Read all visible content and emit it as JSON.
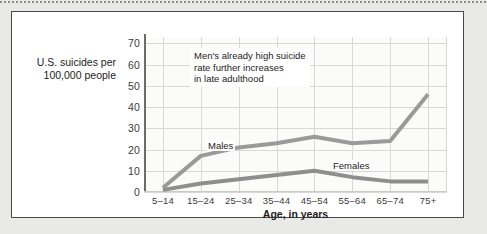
{
  "figure": {
    "y_axis_title": "U.S. suicides per\n100,000 people",
    "x_axis_title": "Age, in years",
    "annotation": "Men's already high suicide\nrate further increases\nin late adulthood",
    "males_label": "Males",
    "females_label": "Females"
  },
  "chart_data": {
    "type": "line",
    "title": "",
    "xlabel": "Age, in years",
    "ylabel": "U.S. suicides per 100,000 people",
    "categories": [
      "5–14",
      "15–24",
      "25–34",
      "35–44",
      "45–54",
      "55–64",
      "65–74",
      "75+"
    ],
    "ytick_labels": [
      "0",
      "10",
      "20",
      "30",
      "40",
      "50",
      "60",
      "70"
    ],
    "yticks": [
      0,
      10,
      20,
      30,
      40,
      50,
      60,
      70
    ],
    "ylim": [
      0,
      73
    ],
    "grid": true,
    "legend_position": "inline-labels",
    "annotations": [
      {
        "text": "Men's already high suicide rate further increases in late adulthood",
        "x_category": "25–34",
        "y": 63
      }
    ],
    "series": [
      {
        "name": "Males",
        "color": "#9a9a9a",
        "values": [
          2,
          17,
          21,
          23,
          26,
          23,
          24,
          46
        ]
      },
      {
        "name": "Females",
        "color": "#8e8e8e",
        "values": [
          1,
          4,
          6,
          8,
          10,
          7,
          5,
          5
        ]
      }
    ]
  },
  "colors": {
    "page_background": "#e9e9e7",
    "frame_border": "#4a4a4a",
    "chart_background": "#ffffff",
    "plot_background": "#fbfbfa",
    "gridline": "#d8d8d4",
    "axis": "#6b6b6b",
    "males_line": "#9a9a9a",
    "females_line": "#8e8e8e",
    "text": "#1d1d1d"
  }
}
